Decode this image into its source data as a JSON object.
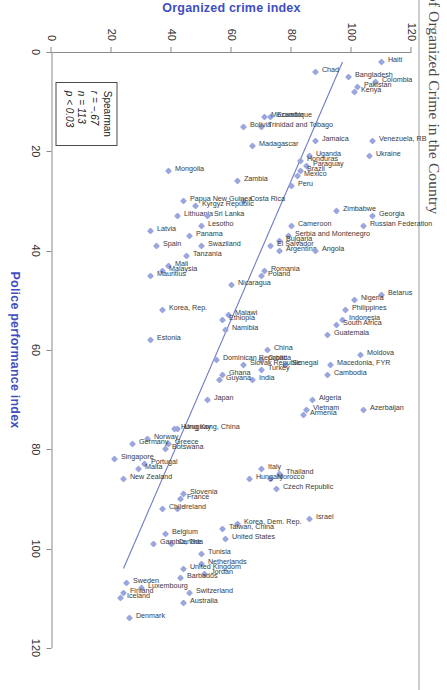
{
  "figure": {
    "title": "of Organized Crime in the Country",
    "sample_size_note": "n = 113"
  },
  "chart_data": {
    "type": "scatter",
    "title": "of Organized Crime in the Country",
    "xlabel": "Police performance index",
    "ylabel": "Organized crime index",
    "xlim": [
      0,
      120
    ],
    "ylim": [
      0,
      120
    ],
    "xticks": [
      0,
      20,
      40,
      60,
      80,
      100,
      120
    ],
    "yticks": [
      0,
      20,
      40,
      60,
      80,
      100,
      120
    ],
    "grid": false,
    "legend": null,
    "marker_color": "#9aa6dd",
    "fit_line_color": "#6f7bc4",
    "fit_line": {
      "x0": 2,
      "y0": 97,
      "x1": 104,
      "y1": 24
    },
    "annotations": {
      "stats_title": "Spearman",
      "r": "r = −.67",
      "n": "n = 113",
      "p": "p < 0.03"
    },
    "points": [
      {
        "label": "Haiti",
        "x": 2,
        "y": 110
      },
      {
        "label": "Colombia",
        "x": 6,
        "y": 108
      },
      {
        "label": "Pakistan",
        "x": 7,
        "y": 102
      },
      {
        "label": "Kenya",
        "x": 8,
        "y": 101
      },
      {
        "label": "Bangladesh",
        "x": 5,
        "y": 99
      },
      {
        "label": "Chad",
        "x": 4,
        "y": 88
      },
      {
        "label": "Ecuador",
        "x": 13,
        "y": 73
      },
      {
        "label": "Mozambique",
        "x": 13,
        "y": 71
      },
      {
        "label": "Trinidad and Tobago",
        "x": 15,
        "y": 70
      },
      {
        "label": "Bolivia",
        "x": 15,
        "y": 64
      },
      {
        "label": "Madagascar",
        "x": 19,
        "y": 67
      },
      {
        "label": "Venezuela, RB",
        "x": 18,
        "y": 107
      },
      {
        "label": "Ukraine",
        "x": 21,
        "y": 106
      },
      {
        "label": "Jamaica",
        "x": 18,
        "y": 88
      },
      {
        "label": "Uganda",
        "x": 21,
        "y": 86
      },
      {
        "label": "Paraguay",
        "x": 23,
        "y": 85
      },
      {
        "label": "Honduras",
        "x": 22,
        "y": 83
      },
      {
        "label": "Brazil",
        "x": 24,
        "y": 83
      },
      {
        "label": "Mexico",
        "x": 25,
        "y": 82
      },
      {
        "label": "Peru",
        "x": 27,
        "y": 80
      },
      {
        "label": "Zambia",
        "x": 26,
        "y": 62
      },
      {
        "label": "Costa Rica",
        "x": 30,
        "y": 64
      },
      {
        "label": "Mongolia",
        "x": 24,
        "y": 39
      },
      {
        "label": "Papua New Guinea",
        "x": 30,
        "y": 44
      },
      {
        "label": "Lithuania",
        "x": 33,
        "y": 42
      },
      {
        "label": "Kyrgyz Republic",
        "x": 31,
        "y": 48
      },
      {
        "label": "Sri Lanka",
        "x": 33,
        "y": 52
      },
      {
        "label": "Lesotho",
        "x": 35,
        "y": 50
      },
      {
        "label": "Panama",
        "x": 37,
        "y": 46
      },
      {
        "label": "Swaziland",
        "x": 39,
        "y": 50
      },
      {
        "label": "Tanzania",
        "x": 41,
        "y": 45
      },
      {
        "label": "Latvia",
        "x": 36,
        "y": 33
      },
      {
        "label": "Spain",
        "x": 39,
        "y": 35
      },
      {
        "label": "Mali",
        "x": 43,
        "y": 39
      },
      {
        "label": "Malaysia",
        "x": 44,
        "y": 37
      },
      {
        "label": "Mauritius",
        "x": 45,
        "y": 33
      },
      {
        "label": "Georgia",
        "x": 33,
        "y": 107
      },
      {
        "label": "Russian Federation",
        "x": 35,
        "y": 104
      },
      {
        "label": "Zimbabwe",
        "x": 32,
        "y": 95
      },
      {
        "label": "Cameroon",
        "x": 35,
        "y": 80
      },
      {
        "label": "Serbia and Montenegro",
        "x": 37,
        "y": 79
      },
      {
        "label": "Bulgaria",
        "x": 38,
        "y": 76
      },
      {
        "label": "Argentina",
        "x": 40,
        "y": 76
      },
      {
        "label": "El Salvador",
        "x": 39,
        "y": 73
      },
      {
        "label": "Angola",
        "x": 40,
        "y": 88
      },
      {
        "label": "Romania",
        "x": 44,
        "y": 71
      },
      {
        "label": "Poland",
        "x": 45,
        "y": 70
      },
      {
        "label": "Nicaragua",
        "x": 47,
        "y": 60
      },
      {
        "label": "Belarus",
        "x": 49,
        "y": 110
      },
      {
        "label": "Nigeria",
        "x": 50,
        "y": 101
      },
      {
        "label": "Philippines",
        "x": 52,
        "y": 98
      },
      {
        "label": "Indonesia",
        "x": 54,
        "y": 97
      },
      {
        "label": "South Africa",
        "x": 55,
        "y": 95
      },
      {
        "label": "Guatemala",
        "x": 57,
        "y": 92
      },
      {
        "label": "Malawi",
        "x": 53,
        "y": 59
      },
      {
        "label": "Ethiopia",
        "x": 54,
        "y": 57
      },
      {
        "label": "Namibia",
        "x": 56,
        "y": 58
      },
      {
        "label": "Korea, Rep.",
        "x": 52,
        "y": 37
      },
      {
        "label": "Estonia",
        "x": 58,
        "y": 33
      },
      {
        "label": "Moldova",
        "x": 61,
        "y": 103
      },
      {
        "label": "Macedonia, FYR",
        "x": 63,
        "y": 93
      },
      {
        "label": "Cambodia",
        "x": 65,
        "y": 92
      },
      {
        "label": "Senegal",
        "x": 63,
        "y": 78
      },
      {
        "label": "China",
        "x": 60,
        "y": 72
      },
      {
        "label": "Croatia",
        "x": 62,
        "y": 70
      },
      {
        "label": "Turkey",
        "x": 64,
        "y": 70
      },
      {
        "label": "Slovak Republic",
        "x": 63,
        "y": 64
      },
      {
        "label": "India",
        "x": 66,
        "y": 67
      },
      {
        "label": "Dominican Republic",
        "x": 62,
        "y": 55
      },
      {
        "label": "Ghana",
        "x": 65,
        "y": 57
      },
      {
        "label": "Guyana",
        "x": 66,
        "y": 56
      },
      {
        "label": "Azerbaijan",
        "x": 72,
        "y": 104
      },
      {
        "label": "Algeria",
        "x": 70,
        "y": 87
      },
      {
        "label": "Vietnam",
        "x": 72,
        "y": 85
      },
      {
        "label": "Armenia",
        "x": 73,
        "y": 84
      },
      {
        "label": "Japan",
        "x": 70,
        "y": 52
      },
      {
        "label": "Uruguay",
        "x": 76,
        "y": 42
      },
      {
        "label": "Hong Kong, China",
        "x": 76,
        "y": 41
      },
      {
        "label": "Greece",
        "x": 79,
        "y": 39
      },
      {
        "label": "Botswana",
        "x": 80,
        "y": 38
      },
      {
        "label": "Norway",
        "x": 78,
        "y": 32
      },
      {
        "label": "Germany",
        "x": 79,
        "y": 27
      },
      {
        "label": "Portugal",
        "x": 83,
        "y": 31
      },
      {
        "label": "Malta",
        "x": 84,
        "y": 29
      },
      {
        "label": "Singapore",
        "x": 82,
        "y": 21
      },
      {
        "label": "New Zealand",
        "x": 86,
        "y": 24
      },
      {
        "label": "Thailand",
        "x": 85,
        "y": 76
      },
      {
        "label": "Italy",
        "x": 84,
        "y": 70
      },
      {
        "label": "Morocco",
        "x": 86,
        "y": 73
      },
      {
        "label": "Czech Republic",
        "x": 88,
        "y": 75
      },
      {
        "label": "Hungary",
        "x": 86,
        "y": 66
      },
      {
        "label": "Slovenia",
        "x": 89,
        "y": 44
      },
      {
        "label": "France",
        "x": 90,
        "y": 43
      },
      {
        "label": "Ireland",
        "x": 92,
        "y": 42
      },
      {
        "label": "Chile",
        "x": 92,
        "y": 37
      },
      {
        "label": "Israel",
        "x": 94,
        "y": 86
      },
      {
        "label": "Korea, Dem. Rep.",
        "x": 95,
        "y": 62
      },
      {
        "label": "Taiwan, China",
        "x": 96,
        "y": 57
      },
      {
        "label": "United States",
        "x": 98,
        "y": 58
      },
      {
        "label": "Belgium",
        "x": 97,
        "y": 38
      },
      {
        "label": "Canada",
        "x": 99,
        "y": 40
      },
      {
        "label": "Gambia, The",
        "x": 99,
        "y": 34
      },
      {
        "label": "Tunisia",
        "x": 101,
        "y": 50
      },
      {
        "label": "Netherlands",
        "x": 103,
        "y": 50
      },
      {
        "label": "Jordan",
        "x": 105,
        "y": 51
      },
      {
        "label": "United Kingdom",
        "x": 104,
        "y": 44
      },
      {
        "label": "Barbados",
        "x": 106,
        "y": 43
      },
      {
        "label": "Switzerland",
        "x": 109,
        "y": 46
      },
      {
        "label": "Australia",
        "x": 111,
        "y": 44
      },
      {
        "label": "Luxembourg",
        "x": 108,
        "y": 30
      },
      {
        "label": "Sweden",
        "x": 107,
        "y": 25
      },
      {
        "label": "Finland",
        "x": 109,
        "y": 24
      },
      {
        "label": "Iceland",
        "x": 110,
        "y": 23
      },
      {
        "label": "Denmark",
        "x": 114,
        "y": 26
      }
    ]
  }
}
